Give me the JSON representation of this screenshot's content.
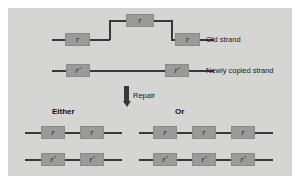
{
  "figure": {
    "panel_color": "#d5d5d3",
    "page_background": "#ffffff",
    "box_color": "#9a9a99",
    "line_color": "#38383a"
  },
  "labels": {
    "old_strand": "Old strand",
    "newly_copied_strand": "Newly copied strand",
    "repair": "Repair",
    "either": "Either",
    "or": "Or"
  },
  "markers": {
    "old": "r",
    "new": "r′"
  },
  "top_panel": {
    "old_strand": {
      "label": "Old strand",
      "boxes": [
        {
          "marker": "r",
          "x": 57,
          "y": 33,
          "w": 25,
          "h": 13
        },
        {
          "marker": "r",
          "x": 121,
          "y": 14,
          "w": 27,
          "h": 13
        },
        {
          "marker": "r",
          "x": 168,
          "y": 33,
          "w": 25,
          "h": 13
        }
      ]
    },
    "new_strand": {
      "label": "Newly copied strand",
      "boxes": [
        {
          "marker": "r′",
          "x": 64,
          "y": 62,
          "w": 23,
          "h": 13
        },
        {
          "marker": "r′",
          "x": 163,
          "y": 62,
          "w": 23,
          "h": 13
        }
      ]
    }
  },
  "outcomes": [
    {
      "heading": "Either",
      "rows": [
        {
          "strand": "old",
          "boxes": [
            {
              "marker": "r",
              "x": 30,
              "y": 130,
              "w": 23,
              "h": 13
            },
            {
              "marker": "r",
              "x": 66,
              "y": 130,
              "w": 23,
              "h": 13
            }
          ]
        },
        {
          "strand": "new",
          "boxes": [
            {
              "marker": "r′",
              "x": 30,
              "y": 155,
              "w": 23,
              "h": 13
            },
            {
              "marker": "r′",
              "x": 66,
              "y": 155,
              "w": 23,
              "h": 13
            }
          ]
        }
      ]
    },
    {
      "heading": "Or",
      "rows": [
        {
          "strand": "old",
          "boxes": [
            {
              "marker": "r",
              "x": 141,
              "y": 130,
              "w": 23,
              "h": 13
            },
            {
              "marker": "r",
              "x": 177,
              "y": 130,
              "w": 23,
              "h": 13
            },
            {
              "marker": "r",
              "x": 213,
              "y": 130,
              "w": 23,
              "h": 13
            }
          ]
        },
        {
          "strand": "new",
          "boxes": [
            {
              "marker": "r′",
              "x": 141,
              "y": 155,
              "w": 23,
              "h": 13
            },
            {
              "marker": "r′",
              "x": 177,
              "y": 155,
              "w": 23,
              "h": 13
            },
            {
              "marker": "r′",
              "x": 213,
              "y": 155,
              "w": 23,
              "h": 13
            }
          ]
        }
      ]
    }
  ]
}
